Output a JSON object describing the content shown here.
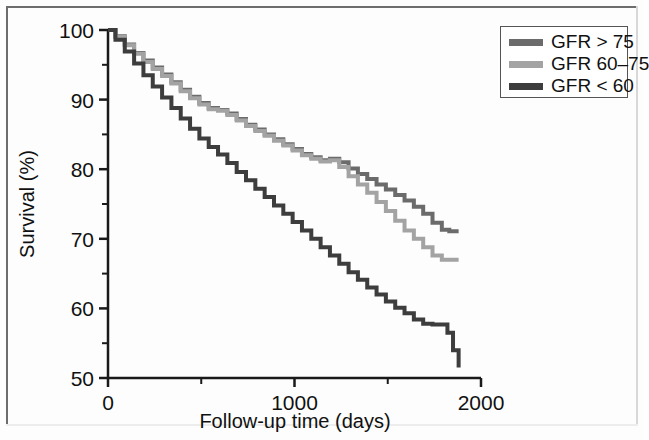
{
  "figure": {
    "background": "#fdfdfd",
    "frame_color": "#6d6d6d"
  },
  "axes": {
    "y_title": "Survival (%)",
    "x_title": "Follow-up time (days)",
    "y_ticks": [
      "100",
      "90",
      "80",
      "70",
      "60",
      "50"
    ],
    "x_ticks": [
      "0",
      "1000",
      "2000"
    ],
    "y_minor": [
      "95",
      "85",
      "75",
      "65",
      "55"
    ],
    "x_minor": [
      "500",
      "1500"
    ],
    "axis_color": "#1a1a1a"
  },
  "legend": {
    "items": [
      {
        "label": "GFR > 75",
        "color": "#6b6b6b"
      },
      {
        "label": "GFR 60–75",
        "color": "#a3a3a3"
      },
      {
        "label": "GFR < 60",
        "color": "#3d3d3d"
      }
    ]
  },
  "chart_data": {
    "type": "line",
    "title": "",
    "subtitle": "",
    "xlabel": "Follow-up time (days)",
    "ylabel": "Survival (%)",
    "xlim": [
      0,
      2000
    ],
    "ylim": [
      50,
      100
    ],
    "grid": false,
    "legend_position": "top-right",
    "xticks": [
      0,
      1000,
      2000
    ],
    "yticks": [
      50,
      60,
      70,
      80,
      90,
      100
    ],
    "xticks_minor": [
      500,
      1500
    ],
    "yticks_minor": [
      55,
      65,
      75,
      85,
      95
    ],
    "step_type": "post",
    "series": [
      {
        "name": "GFR > 75",
        "color": "#6b6b6b",
        "x": [
          0,
          40,
          90,
          140,
          190,
          240,
          290,
          340,
          390,
          440,
          490,
          540,
          590,
          640,
          690,
          740,
          790,
          840,
          890,
          940,
          990,
          1040,
          1090,
          1140,
          1190,
          1240,
          1290,
          1340,
          1390,
          1440,
          1490,
          1540,
          1590,
          1640,
          1690,
          1740,
          1790,
          1830,
          1880
        ],
        "y": [
          100,
          99.1,
          97.9,
          96.7,
          95.6,
          94.6,
          93.6,
          92.5,
          91.4,
          90.4,
          89.5,
          88.8,
          88.5,
          88.0,
          87.2,
          86.4,
          85.7,
          85.0,
          84.3,
          83.6,
          82.9,
          82.2,
          81.7,
          81.3,
          81.5,
          81.0,
          80.1,
          79.3,
          78.6,
          77.8,
          77.1,
          76.3,
          75.5,
          74.6,
          73.6,
          72.3,
          71.3,
          71.1,
          71.1
        ]
      },
      {
        "name": "GFR 60–75",
        "color": "#a3a3a3",
        "x": [
          0,
          40,
          90,
          140,
          190,
          240,
          290,
          340,
          390,
          440,
          490,
          540,
          590,
          640,
          690,
          740,
          790,
          840,
          890,
          940,
          990,
          1040,
          1090,
          1140,
          1190,
          1240,
          1290,
          1340,
          1390,
          1440,
          1490,
          1540,
          1590,
          1640,
          1690,
          1740,
          1790,
          1830,
          1880
        ],
        "y": [
          100,
          99.0,
          97.8,
          96.6,
          95.4,
          94.4,
          93.4,
          92.3,
          91.2,
          90.2,
          89.3,
          88.6,
          88.4,
          87.8,
          87.0,
          86.2,
          85.5,
          84.8,
          84.1,
          83.4,
          82.7,
          82.0,
          81.5,
          81.1,
          81.3,
          80.3,
          79.0,
          77.8,
          76.6,
          75.3,
          74.0,
          72.6,
          71.2,
          70.0,
          68.8,
          67.6,
          67.0,
          67.0,
          67.0
        ]
      },
      {
        "name": "GFR < 60",
        "color": "#3d3d3d",
        "x": [
          0,
          40,
          90,
          140,
          190,
          240,
          290,
          340,
          390,
          440,
          490,
          540,
          590,
          640,
          690,
          740,
          790,
          840,
          890,
          940,
          990,
          1040,
          1090,
          1140,
          1190,
          1240,
          1290,
          1340,
          1390,
          1440,
          1490,
          1540,
          1590,
          1640,
          1690,
          1740,
          1790,
          1820,
          1850,
          1880
        ],
        "y": [
          100,
          98.6,
          96.9,
          95.2,
          93.5,
          91.9,
          90.3,
          88.8,
          87.3,
          85.8,
          84.4,
          83.2,
          82.1,
          80.9,
          79.6,
          78.4,
          77.2,
          76.0,
          74.8,
          73.6,
          72.4,
          71.2,
          70.0,
          68.8,
          67.6,
          66.4,
          65.2,
          64.1,
          63.0,
          62.0,
          61.0,
          60.1,
          59.3,
          58.4,
          57.8,
          57.7,
          57.7,
          56.5,
          54.0,
          51.5
        ]
      }
    ]
  }
}
